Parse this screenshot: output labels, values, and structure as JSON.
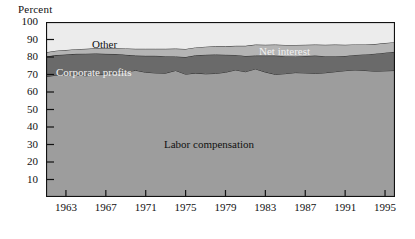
{
  "chart_data": {
    "type": "area",
    "title": "",
    "subtitle": "",
    "ylabel": "Percent",
    "xlabel": "",
    "ylim": [
      0,
      100
    ],
    "xlim": [
      1961,
      1996
    ],
    "grid": false,
    "legend_position": "inline-band-labels",
    "stacked": true,
    "normalized_percent": true,
    "x": [
      1961,
      1962,
      1963,
      1964,
      1965,
      1966,
      1967,
      1968,
      1969,
      1970,
      1971,
      1972,
      1973,
      1974,
      1975,
      1976,
      1977,
      1978,
      1979,
      1980,
      1981,
      1982,
      1983,
      1984,
      1985,
      1986,
      1987,
      1988,
      1989,
      1990,
      1991,
      1992,
      1993,
      1994,
      1995,
      1996
    ],
    "series": [
      {
        "name": "Labor compensation",
        "color": "#9d9d9d",
        "label_color": "#111111",
        "values": [
          68.8,
          69.6,
          69.8,
          69.7,
          69.3,
          69.6,
          70.4,
          70.6,
          71.5,
          72.4,
          71.3,
          70.9,
          70.8,
          72.3,
          70.2,
          70.8,
          70.4,
          70.6,
          71.3,
          72.6,
          71.6,
          73.2,
          71.4,
          70.1,
          70.5,
          71.1,
          70.9,
          70.6,
          71.0,
          71.6,
          72.2,
          72.6,
          72.3,
          71.9,
          72.1,
          72.3
        ]
      },
      {
        "name": "Corporate profits",
        "color": "#6a6a6a",
        "label_color": "#f2f2f2",
        "values": [
          11.5,
          11.5,
          11.6,
          12.1,
          12.6,
          12.4,
          11.4,
          11.1,
          9.8,
          8.4,
          9.4,
          9.8,
          9.7,
          8.0,
          9.8,
          10.2,
          10.9,
          10.8,
          10.0,
          8.6,
          9.0,
          7.6,
          9.4,
          10.7,
          10.0,
          9.2,
          9.7,
          10.2,
          9.5,
          8.9,
          8.4,
          8.6,
          9.2,
          10.0,
          10.4,
          10.7
        ]
      },
      {
        "name": "Net interest",
        "color": "#b4b4b4",
        "label_color": "#f2f2f2",
        "values": [
          2.4,
          2.5,
          2.6,
          2.7,
          2.8,
          3.0,
          3.2,
          3.3,
          3.6,
          3.9,
          4.0,
          4.0,
          4.2,
          4.5,
          4.6,
          4.5,
          4.6,
          4.7,
          4.8,
          5.2,
          5.8,
          6.3,
          6.2,
          6.3,
          6.4,
          6.6,
          6.4,
          6.3,
          6.5,
          6.6,
          6.4,
          6.0,
          5.7,
          5.5,
          5.5,
          5.5
        ]
      },
      {
        "name": "Other",
        "color": "#ececec",
        "label_color": "#111111",
        "values": [
          17.3,
          16.4,
          16.0,
          15.5,
          15.3,
          15.0,
          15.0,
          15.0,
          15.1,
          15.3,
          15.3,
          15.3,
          15.3,
          15.2,
          15.4,
          14.5,
          14.1,
          13.9,
          13.9,
          13.6,
          13.6,
          12.9,
          13.0,
          12.9,
          13.1,
          13.1,
          13.0,
          12.9,
          13.0,
          12.9,
          13.0,
          12.8,
          12.8,
          12.6,
          12.0,
          11.5
        ]
      }
    ],
    "y_ticks": [
      10,
      20,
      30,
      40,
      50,
      60,
      70,
      80,
      90,
      100
    ],
    "x_ticks": [
      1963,
      1967,
      1971,
      1975,
      1979,
      1983,
      1987,
      1991,
      1995
    ],
    "band_labels": [
      {
        "text": "Other",
        "x": 92,
        "y": 38,
        "style": "dark"
      },
      {
        "text": "Net interest",
        "x": 259,
        "y": 45,
        "style": "light"
      },
      {
        "text": "Corporate profits",
        "x": 56,
        "y": 66,
        "style": "light"
      },
      {
        "text": "Labor compensation",
        "x": 164,
        "y": 138,
        "style": "dark"
      }
    ]
  }
}
